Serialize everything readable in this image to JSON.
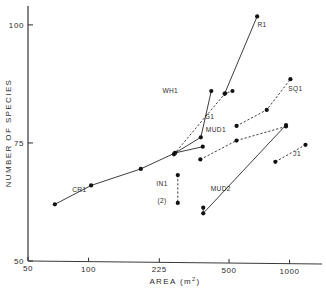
{
  "chart_data": {
    "type": "scatter",
    "title": "",
    "xlabel": "AREA  (m2)",
    "xlabel_base": "AREA  (m",
    "xlabel_sup": "2",
    "xlabel_close": ")",
    "ylabel": "NUMBER OF SPECIES",
    "xscale": "log",
    "yscale": "linear",
    "xlim": [
      50,
      1450
    ],
    "ylim": [
      50,
      104
    ],
    "grid": false,
    "legend": "inline-labels",
    "xticks": [
      50,
      100,
      225,
      500,
      1000
    ],
    "xtick_labels": [
      "50",
      "100",
      "225",
      "500",
      "1000"
    ],
    "yticks": [
      50,
      75,
      100
    ],
    "ytick_labels": [
      "50",
      "75",
      "100"
    ],
    "series": [
      {
        "name": "CR1",
        "linestyle": "solid",
        "label_x": 90,
        "label_y": 64.6,
        "points": [
          {
            "x": 68,
            "y": 62.0
          },
          {
            "x": 103,
            "y": 66.0
          },
          {
            "x": 182,
            "y": 69.5
          },
          {
            "x": 270,
            "y": 72.9
          },
          {
            "x": 370,
            "y": 74.2
          }
        ]
      },
      {
        "name": "WH1",
        "linestyle": "solid",
        "label_x": 255,
        "label_y": 85.6,
        "points": [
          {
            "x": 268,
            "y": 72.8
          },
          {
            "x": 362,
            "y": 76.2
          },
          {
            "x": 408,
            "y": 86.0
          }
        ]
      },
      {
        "name": "G1",
        "linestyle": "dashed",
        "label_x": 400,
        "label_y": 80.0,
        "points": [
          {
            "x": 266,
            "y": 72.6
          },
          {
            "x": 478,
            "y": 85.5
          },
          {
            "x": 520,
            "y": 86.0
          }
        ]
      },
      {
        "name": "R1",
        "linestyle": "solid",
        "label_x": 730,
        "label_y": 99.6,
        "points": [
          {
            "x": 475,
            "y": 85.4
          },
          {
            "x": 690,
            "y": 101.8
          }
        ]
      },
      {
        "name": "SQ1",
        "linestyle": "dashed",
        "label_x": 1070,
        "label_y": 86.0,
        "points": [
          {
            "x": 545,
            "y": 78.6
          },
          {
            "x": 770,
            "y": 82.0
          },
          {
            "x": 1010,
            "y": 88.5
          }
        ]
      },
      {
        "name": "MUD1",
        "linestyle": "dashed",
        "label_x": 430,
        "label_y": 77.4,
        "points": [
          {
            "x": 360,
            "y": 71.5
          },
          {
            "x": 545,
            "y": 75.5
          },
          {
            "x": 960,
            "y": 78.5
          }
        ]
      },
      {
        "name": "MUD2",
        "linestyle": "solid",
        "label_x": 455,
        "label_y": 64.8,
        "points": [
          {
            "x": 372,
            "y": 61.3
          },
          {
            "x": 372,
            "y": 60.1
          },
          {
            "x": 960,
            "y": 78.8
          }
        ]
      },
      {
        "name": "J1",
        "linestyle": "dashed",
        "label_x": 1090,
        "label_y": 72.2,
        "points": [
          {
            "x": 850,
            "y": 71.0
          },
          {
            "x": 1200,
            "y": 74.6
          }
        ]
      },
      {
        "name": "IN1",
        "linestyle": "dashed",
        "label_x": 232,
        "label_y": 65.8,
        "label2": "(2)",
        "label2_x": 232,
        "label2_y": 62.3,
        "points": [
          {
            "x": 278,
            "y": 68.2
          },
          {
            "x": 278,
            "y": 62.3
          }
        ]
      }
    ]
  }
}
